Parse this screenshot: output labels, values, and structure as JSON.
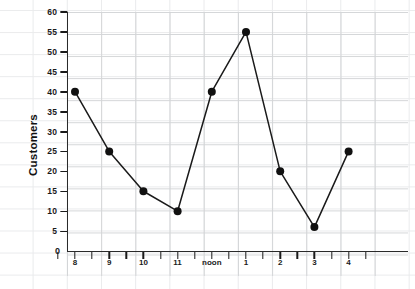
{
  "chart_data": {
    "type": "line",
    "title": "",
    "xlabel": "",
    "ylabel": "Customers",
    "categories": [
      "8",
      "9",
      "10",
      "11",
      "noon",
      "1",
      "2",
      "3",
      "4"
    ],
    "values": [
      40,
      25,
      15,
      10,
      40,
      55,
      20,
      6,
      25
    ],
    "series": [
      {
        "name": "Customers",
        "values": [
          40,
          25,
          15,
          10,
          40,
          55,
          20,
          6,
          25
        ]
      }
    ],
    "ylim": [
      0,
      60
    ],
    "ytick_labels": [
      "0",
      "5",
      "10",
      "15",
      "20",
      "25",
      "30",
      "35",
      "40",
      "45",
      "50",
      "55",
      "60"
    ],
    "ytick_values": [
      0,
      5,
      10,
      15,
      20,
      25,
      30,
      35,
      40,
      45,
      50,
      55,
      60
    ],
    "grid": true,
    "grid_style": "graph-paper",
    "legend": "none",
    "marker": "filled-circle",
    "line_color": "#1a1a1a",
    "marker_color": "#111111",
    "grid_color": "#d2d4d6",
    "axis_color": "#2a2a2a",
    "background": "#ffffff"
  }
}
